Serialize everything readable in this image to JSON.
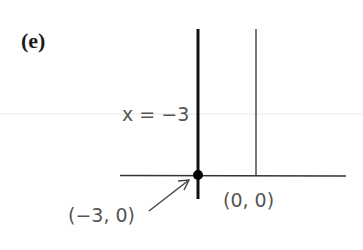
{
  "figure": {
    "panel_label": "(e)",
    "equation_label": "x = −3",
    "point_label": "(−3, 0)",
    "origin_label": "(0, 0)"
  },
  "diagram": {
    "type": "coordinate-plot",
    "x_axis": {
      "from_px": [
        120,
        175
      ],
      "to_px": [
        346,
        175
      ]
    },
    "y_axis": {
      "x_px": 256,
      "from_y_px": 29,
      "to_y_px": 175
    },
    "bold_line": {
      "equation": "x = -3",
      "x_px": 198,
      "from_y_px": 29,
      "to_y_px": 199
    },
    "marked_point": {
      "coords": [
        -3,
        0
      ],
      "center_px": [
        198,
        175
      ]
    },
    "origin": {
      "coords": [
        0,
        0
      ],
      "center_px": [
        256,
        175
      ]
    },
    "colors": {
      "line": "#1a1a1a",
      "label_text": "#555555",
      "scan_artifact": "#e6e6e6"
    }
  }
}
